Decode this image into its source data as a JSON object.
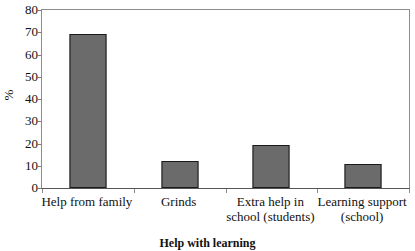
{
  "chart_data": {
    "type": "bar",
    "title": "",
    "xlabel": "Help with learning",
    "ylabel": "%",
    "categories": [
      "Help from family",
      "Grinds",
      "Extra help in school (students)",
      "Learning support (school)"
    ],
    "values": [
      69,
      12,
      19.5,
      11
    ],
    "ylim": [
      0,
      80
    ],
    "yticks": [
      0,
      10,
      20,
      30,
      40,
      50,
      60,
      70,
      80
    ],
    "ytick_labels": [
      "0",
      "10",
      "20",
      "30",
      "40",
      "50",
      "60",
      "70",
      "80"
    ],
    "grid": false,
    "legend": null,
    "bar_color": "#6b6b6b",
    "bar_border_color": "#1a1a1a",
    "axis_color": "#8d8d8d",
    "background": "#ffffff"
  },
  "category_label_lines": [
    [
      "Help from family"
    ],
    [
      "Grinds"
    ],
    [
      "Extra help in",
      "school (students)"
    ],
    [
      "Learning support",
      "(school)"
    ]
  ]
}
